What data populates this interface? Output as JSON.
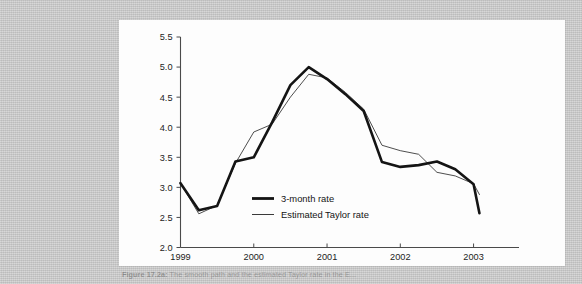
{
  "page": {
    "background_color": "#c9c9c9",
    "figure_background_color": "#fdfdfd"
  },
  "caption": {
    "label": "Figure 17.2a:",
    "text": " The smooth path and the estimated Taylor rate in the E..."
  },
  "chart_data": {
    "type": "line",
    "title": "",
    "subtitle": "",
    "xlabel": "",
    "ylabel": "",
    "xlim": [
      1999.0,
      2003.1
    ],
    "ylim": [
      2.0,
      5.5
    ],
    "ytick_labels": [
      "2.0",
      "2.5",
      "3.0",
      "3.5",
      "4.0",
      "4.5",
      "5.0",
      "5.5"
    ],
    "ytick_values": [
      2.0,
      2.5,
      3.0,
      3.5,
      4.0,
      4.5,
      5.0,
      5.5
    ],
    "xtick_labels": [
      "1999",
      "2000",
      "2001",
      "2002",
      "2003"
    ],
    "xtick_values": [
      1999,
      2000,
      2001,
      2002,
      2003
    ],
    "grid": false,
    "legend_position": "center",
    "x": [
      1999.0,
      1999.25,
      1999.5,
      1999.75,
      2000.0,
      2000.25,
      2000.5,
      2000.75,
      2001.0,
      2001.25,
      2001.5,
      2001.75,
      2002.0,
      2002.25,
      2002.5,
      2002.75,
      2003.0,
      2003.08
    ],
    "series": [
      {
        "name": "3-month rate",
        "color": "#141414",
        "width": 2.6,
        "values": [
          3.07,
          2.62,
          2.69,
          3.43,
          3.5,
          4.08,
          4.7,
          5.0,
          4.8,
          4.55,
          4.27,
          3.42,
          3.34,
          3.37,
          3.43,
          3.3,
          3.05,
          2.57
        ]
      },
      {
        "name": "Estimated Taylor rate",
        "color": "#3a3a3a",
        "width": 0.9,
        "values": [
          3.07,
          2.56,
          2.7,
          3.4,
          3.92,
          4.05,
          4.5,
          4.88,
          4.82,
          4.58,
          4.3,
          3.7,
          3.61,
          3.55,
          3.25,
          3.19,
          3.06,
          2.88
        ]
      }
    ],
    "legend_entries": [
      {
        "label": "3-month rate",
        "style": "thick-line"
      },
      {
        "label": "Estimated Taylor rate",
        "style": "thin-line"
      }
    ]
  }
}
